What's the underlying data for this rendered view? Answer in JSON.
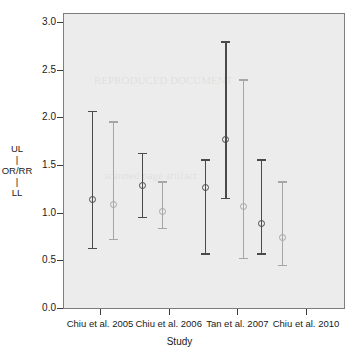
{
  "chart_data": {
    "type": "scatter",
    "title": "",
    "xlabel": "Study",
    "ylabel": "UL | OR/RR | LL",
    "ylabel_lines": [
      "UL",
      "|",
      "OR/RR",
      "|",
      "LL"
    ],
    "ylim": [
      0.0,
      3.0
    ],
    "yticks": [
      0.0,
      0.5,
      1.0,
      1.5,
      2.0,
      2.5,
      3.0
    ],
    "ytick_labels": [
      "0.0",
      "0.5",
      "1.0",
      "1.5",
      "2.0",
      "2.5",
      "3.0"
    ],
    "grid": false,
    "legend": "none",
    "categories": [
      "Chiu et al. 2005",
      "Chiu et al. 2006",
      "Tan et al. 2007",
      "Chiu et al. 2010"
    ],
    "series": [
      {
        "name": "dark",
        "color": "#4a4a4a",
        "points": [
          {
            "category": "Chiu et al. 2005",
            "x": 0.88,
            "or_rr": 1.15,
            "ll": 0.63,
            "ul": 2.08
          },
          {
            "category": "Chiu et al. 2006",
            "x": 1.6,
            "or_rr": 1.3,
            "ll": 0.95,
            "ul": 1.64
          },
          {
            "category": "Tan et al. 2007",
            "x": 2.52,
            "or_rr": 1.27,
            "ll": 0.57,
            "ul": 1.57
          },
          {
            "category": "Tan et al. 2007",
            "x": 2.82,
            "or_rr": 1.78,
            "ll": 1.15,
            "ul": 2.81
          },
          {
            "category": "Chiu et al. 2010",
            "x": 3.34,
            "or_rr": 0.9,
            "ll": 0.57,
            "ul": 1.57
          }
        ]
      },
      {
        "name": "light",
        "color": "#a6a6a6",
        "points": [
          {
            "category": "Chiu et al. 2005",
            "x": 1.18,
            "or_rr": 1.1,
            "ll": 0.72,
            "ul": 1.97
          },
          {
            "category": "Chiu et al. 2006",
            "x": 1.9,
            "or_rr": 1.02,
            "ll": 0.84,
            "ul": 1.34
          },
          {
            "category": "Tan et al. 2007",
            "x": 3.08,
            "or_rr": 1.08,
            "ll": 0.52,
            "ul": 2.41
          },
          {
            "category": "Chiu et al. 2010",
            "x": 3.64,
            "or_rr": 0.75,
            "ll": 0.45,
            "ul": 1.34
          }
        ]
      }
    ]
  },
  "panel": {
    "background_color": "#ececec",
    "border_color": "#7d7d7d"
  },
  "watermarks": [
    "REPRODUCED DOCUMENT",
    "scanned page artifact"
  ]
}
